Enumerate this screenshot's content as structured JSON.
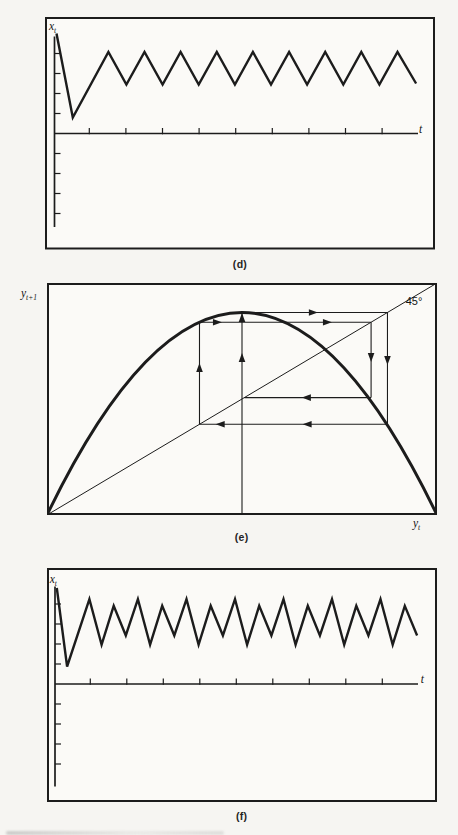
{
  "figure": {
    "colors": {
      "ink": "#1c1c1c",
      "paper": "#f6f5f2",
      "panel_fill": "#fbfaf7"
    },
    "panels": {
      "d": {
        "caption": "(d)",
        "ylabel_var": "x",
        "ylabel_sub": "t",
        "xlabel": "t"
      },
      "e": {
        "caption": "(e)",
        "ylabel_var": "y",
        "ylabel_sub": "t+1",
        "xlabel_var": "y",
        "xlabel_sub": "t",
        "angle_label": "45°"
      },
      "f": {
        "caption": "(f)",
        "ylabel_var": "x",
        "ylabel_sub": "t",
        "xlabel": "t"
      }
    }
  },
  "chart_data": [
    {
      "panel": "(d)",
      "type": "line",
      "subtype": "time-series",
      "title": "(d)",
      "xlabel": "t",
      "ylabel": "x_t",
      "behavior": "transient then sustained period-2 oscillation (peaks equal height, troughs equal height)",
      "grid": false,
      "axis_tick_labels": "none (unlabeled ticks on both axes)",
      "xlim": [
        0,
        20.6
      ],
      "ylim": [
        -0.95,
        1.15
      ],
      "x": [
        0,
        0.9,
        2.87,
        3.87,
        4.87,
        5.87,
        6.87,
        7.87,
        8.87,
        9.87,
        10.87,
        11.87,
        12.87,
        13.87,
        14.87,
        15.87,
        16.87,
        17.87,
        18.87,
        19.9
      ],
      "values": [
        1.0,
        0.16,
        0.815,
        0.49,
        0.815,
        0.49,
        0.815,
        0.49,
        0.815,
        0.49,
        0.815,
        0.49,
        0.815,
        0.49,
        0.815,
        0.49,
        0.815,
        0.49,
        0.815,
        0.5
      ]
    },
    {
      "panel": "(e)",
      "type": "line",
      "subtype": "cobweb phase diagram",
      "title": "(e)",
      "xlabel": "y_t",
      "ylabel": "y_t+1",
      "diagonal_label": "45°",
      "behavior": "cobweb of a period-4 cycle on a one-hump map",
      "curve": {
        "shape": "inverted parabola from origin to far corner",
        "peak_at": 0.5,
        "peak_value": 0.873
      },
      "diagonal": {
        "from": [
          0,
          0
        ],
        "to": [
          1,
          1
        ]
      },
      "trajectory": [
        0.5,
        0.873,
        0.391,
        0.831,
        0.506
      ],
      "xlim": [
        0,
        1
      ],
      "ylim": [
        0,
        1
      ],
      "segments": [
        {
          "orient": "v",
          "at": 0.5,
          "from": 0.0,
          "to": 0.873,
          "dir": "up",
          "arrows": [
            0.679,
            0.851
          ]
        },
        {
          "orient": "h",
          "at": 0.873,
          "from": 0.5,
          "to": 0.873,
          "dir": "right",
          "arrows": [
            0.683
          ]
        },
        {
          "orient": "v",
          "at": 0.873,
          "from": 0.873,
          "to": 0.391,
          "dir": "down",
          "arrows": [
            0.666
          ]
        },
        {
          "orient": "h",
          "at": 0.391,
          "from": 0.873,
          "to": 0.391,
          "dir": "left",
          "arrows": [
            0.667,
            0.444
          ]
        },
        {
          "orient": "v",
          "at": 0.391,
          "from": 0.391,
          "to": 0.831,
          "dir": "up",
          "arrows": [
            0.636
          ]
        },
        {
          "orient": "h",
          "at": 0.831,
          "from": 0.391,
          "to": 0.831,
          "dir": "right",
          "arrows": [
            0.437,
            0.719
          ]
        },
        {
          "orient": "v",
          "at": 0.831,
          "from": 0.831,
          "to": 0.506,
          "dir": "down",
          "arrows": [
            0.679
          ]
        },
        {
          "orient": "h",
          "at": 0.506,
          "from": 0.831,
          "to": 0.506,
          "dir": "left",
          "arrows": [
            0.665
          ]
        }
      ]
    },
    {
      "panel": "(f)",
      "type": "line",
      "subtype": "time-series",
      "title": "(f)",
      "xlabel": "t",
      "ylabel": "x_t",
      "behavior": "transient then sustained period-4 oscillation (alternating high/low peaks and deep/shallow troughs)",
      "grid": false,
      "axis_tick_labels": "none (unlabeled ticks on both axes)",
      "xlim": [
        0,
        30.4
      ],
      "ylim": [
        -1.05,
        1.15
      ],
      "x": [
        0,
        0.85,
        2.69,
        3.69,
        4.69,
        5.69,
        6.69,
        7.69,
        8.69,
        9.69,
        10.69,
        11.69,
        12.69,
        13.69,
        14.69,
        15.69,
        16.69,
        17.69,
        18.69,
        19.69,
        20.69,
        21.69,
        22.69,
        23.69,
        24.69,
        25.69,
        26.69,
        27.69,
        28.69,
        29.7
      ],
      "values": [
        0.99,
        0.18,
        0.875,
        0.405,
        0.805,
        0.5,
        0.875,
        0.405,
        0.805,
        0.5,
        0.875,
        0.405,
        0.805,
        0.5,
        0.875,
        0.405,
        0.805,
        0.5,
        0.875,
        0.405,
        0.805,
        0.5,
        0.875,
        0.405,
        0.805,
        0.5,
        0.875,
        0.405,
        0.805,
        0.5
      ]
    }
  ]
}
